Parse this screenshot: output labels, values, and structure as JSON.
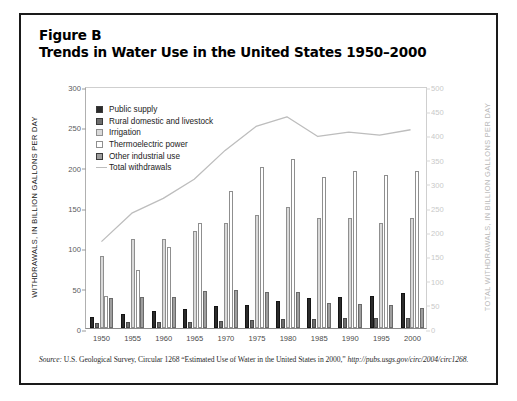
{
  "figure": {
    "title_line1": "Figure B",
    "title_line2": "Trends in Water Use in the United States 1950–2000",
    "source_prefix": "Source:",
    "source_text": " U.S. Geological Survey, Circular 1268 “Estimated Use of Water in the United States in 2000,” ",
    "source_url": "http://pubs.usgs.gov/circ/2004/circ1268."
  },
  "legend": {
    "items": [
      {
        "label": "Public supply",
        "type": "swatch",
        "color": "#2b2b2b"
      },
      {
        "label": "Rural domestic and livestock",
        "type": "swatch",
        "color": "#6e6e6e"
      },
      {
        "label": "Irrigation",
        "type": "swatch",
        "color": "#d9d9d9"
      },
      {
        "label": "Thermoelectric power",
        "type": "swatch",
        "color": "#ffffff"
      },
      {
        "label": "Other industrial use",
        "type": "swatch",
        "color": "#9e9e9e"
      },
      {
        "label": "Total withdrawals",
        "type": "line",
        "color": "#bdbdbd"
      }
    ]
  },
  "chart_data": {
    "type": "bar",
    "title": "Trends in Water Use in the United States 1950–2000",
    "xlabel": "",
    "ylabel": "WITHDRAWALS, IN BILLION GALLONS PER DAY",
    "y2label": "TOTAL WITHDRAWALS, IN BILLION GALLONS PER DAY",
    "categories": [
      "1950",
      "1955",
      "1960",
      "1965",
      "1970",
      "1975",
      "1980",
      "1985",
      "1990",
      "1995",
      "2000"
    ],
    "ylim": [
      0,
      300
    ],
    "yticks": [
      0,
      50,
      100,
      150,
      200,
      250,
      300
    ],
    "y2lim": [
      0,
      500
    ],
    "y2ticks": [
      0,
      50,
      100,
      150,
      200,
      250,
      300,
      350,
      400,
      450,
      500
    ],
    "grid": false,
    "legend_position": "upper-left-inside",
    "series": [
      {
        "name": "Public supply",
        "color": "#2b2b2b",
        "values": [
          14,
          17,
          21,
          24,
          27,
          29,
          34,
          37,
          39,
          40,
          43
        ]
      },
      {
        "name": "Rural domestic and livestock",
        "color": "#6e6e6e",
        "values": [
          6,
          7,
          7,
          8,
          9,
          10,
          11,
          11,
          12,
          12,
          12
        ]
      },
      {
        "name": "Irrigation",
        "color": "#d9d9d9",
        "values": [
          89,
          110,
          110,
          120,
          130,
          140,
          150,
          137,
          137,
          130,
          137
        ]
      },
      {
        "name": "Thermoelectric power",
        "color": "#ffffff",
        "values": [
          40,
          72,
          100,
          130,
          170,
          200,
          210,
          187,
          195,
          190,
          195
        ]
      },
      {
        "name": "Other industrial use",
        "color": "#9e9e9e",
        "values": [
          37,
          39,
          38,
          46,
          47,
          45,
          45,
          31,
          30,
          29,
          25
        ]
      }
    ],
    "line_series": {
      "name": "Total withdrawals",
      "color": "#bdbdbd",
      "axis": "right",
      "values": [
        180,
        240,
        270,
        310,
        370,
        420,
        440,
        399,
        408,
        402,
        413
      ]
    }
  }
}
